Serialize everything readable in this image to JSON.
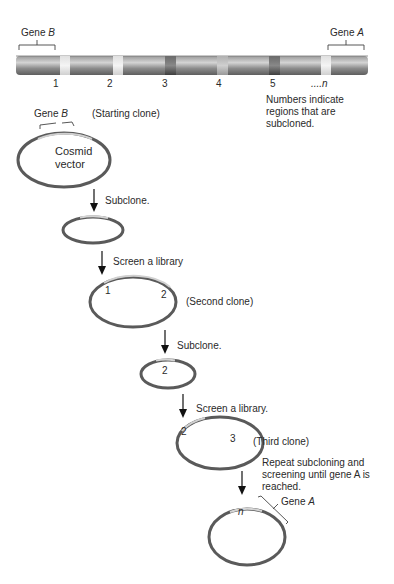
{
  "chromosome": {
    "gene_b_label": "Gene ",
    "gene_b_italic": "B",
    "gene_a_label": "Gene ",
    "gene_a_italic": "A",
    "region_numbers": [
      "1",
      "2",
      "3",
      "4",
      "5",
      "....n"
    ],
    "note": "Numbers indicate regions that are subcloned."
  },
  "steps": {
    "starting_clone": {
      "gene_label": "Gene ",
      "gene_italic": "B",
      "caption": "(Starting clone)",
      "vector_line1": "Cosmid",
      "vector_line2": "vector"
    },
    "subclone_1": "Subclone.",
    "screen_1": "Screen a library",
    "second_clone": {
      "caption": "(Second clone)",
      "region_left": "1",
      "region_right": "2"
    },
    "subclone_2": "Subclone.",
    "subclone_2_region": "2",
    "screen_2": "Screen a library.",
    "third_clone": {
      "caption": "(Third clone)",
      "region_left": "2",
      "region_right": "3"
    },
    "repeat_note": "Repeat subcloning and screening until gene A is reached.",
    "final_clone": {
      "region": "n",
      "gene_label": "Gene ",
      "gene_italic": "A"
    }
  },
  "colors": {
    "chromosome_dark": "#6e6e6e",
    "chromosome_light": "#c8c8c8",
    "band_light": "#e6e6e6",
    "band_dark": "#4a4a4a",
    "band_mid": "#a0a0a0",
    "plasmid_stroke": "#5a5a5a"
  }
}
